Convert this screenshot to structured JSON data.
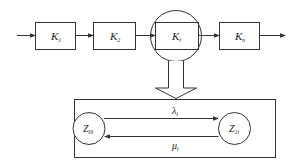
{
  "diagram": {
    "type": "series-system block diagram with state transition",
    "stroke_color": "#333333",
    "chain": [
      {
        "id": "k1",
        "label": "K",
        "subscript": "1"
      },
      {
        "id": "k2",
        "label": "K",
        "subscript": "2"
      },
      {
        "id": "ki",
        "label": "K",
        "subscript": "i",
        "highlighted": true
      },
      {
        "id": "kn",
        "label": "K",
        "subscript": "n"
      }
    ],
    "expansion": {
      "states": [
        {
          "id": "z0i",
          "label": "Z",
          "subscript": "0i"
        },
        {
          "id": "z1i",
          "label": "Z",
          "subscript": "1i"
        }
      ],
      "transitions": [
        {
          "from": "z0i",
          "to": "z1i",
          "label": "λ",
          "subscript": "i"
        },
        {
          "from": "z1i",
          "to": "z0i",
          "label": "μ",
          "subscript": "i"
        }
      ]
    }
  }
}
